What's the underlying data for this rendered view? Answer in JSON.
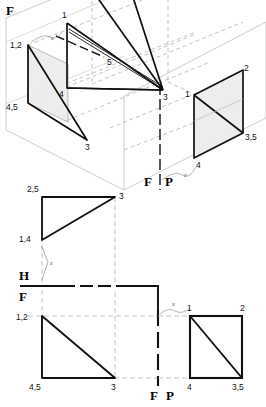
{
  "plate": {
    "title": "Descriptive Geometry — Point/Plane Projection Plate",
    "background_color": "#ffffff",
    "line_color": "#111111",
    "construction_color": "#9a9a9a",
    "shade_color": "#e8e8e8",
    "width": 266,
    "height": 407
  },
  "axonometric": {
    "name": "pictorial-axonometric-view",
    "plane_labels": {
      "frontal_top": "F",
      "frontal_bottom": "F",
      "profile_bottom": "P"
    },
    "vertex_labels": [
      {
        "text": "1,2",
        "x": 10,
        "y": 46
      },
      {
        "text": "4,5",
        "x": 8,
        "y": 108
      },
      {
        "text": "3",
        "x": 84,
        "y": 147
      },
      {
        "text": "4",
        "x": 60,
        "y": 90
      },
      {
        "text": "5",
        "x": 108,
        "y": 62
      },
      {
        "text": "1",
        "x": 61,
        "y": 14
      },
      {
        "text": "3",
        "x": 164,
        "y": 97
      },
      {
        "text": "1",
        "x": 186,
        "y": 94
      },
      {
        "text": "2",
        "x": 245,
        "y": 69
      },
      {
        "text": "3,5",
        "x": 245,
        "y": 137
      },
      {
        "text": "4",
        "x": 196,
        "y": 165
      }
    ],
    "dimension_marks": [
      {
        "text": "x",
        "x": 51,
        "y": 40
      },
      {
        "text": "x",
        "x": 186,
        "y": 177
      }
    ]
  },
  "top_view": {
    "name": "horizontal-projection-view",
    "plane_label": "H",
    "vertex_labels": [
      {
        "text": "2,5",
        "x": 29,
        "y": 190
      },
      {
        "text": "3",
        "x": 119,
        "y": 196
      },
      {
        "text": "1,4",
        "x": 22,
        "y": 240
      }
    ],
    "dimension_marks": [
      {
        "text": "x",
        "x": 48,
        "y": 265
      }
    ]
  },
  "fold_line": {
    "name": "h-f-fold-line",
    "upper_label": "H",
    "lower_label": "F"
  },
  "front_view": {
    "name": "frontal-projection-view",
    "vertex_labels": [
      {
        "text": "1,2",
        "x": 18,
        "y": 318
      },
      {
        "text": "4,5",
        "x": 31,
        "y": 385
      },
      {
        "text": "3",
        "x": 110,
        "y": 385
      }
    ]
  },
  "profile_view": {
    "name": "profile-projection-view",
    "vertex_labels": [
      {
        "text": "1",
        "x": 168,
        "y": 313
      },
      {
        "text": "2",
        "x": 243,
        "y": 313
      },
      {
        "text": "4",
        "x": 170,
        "y": 385
      },
      {
        "text": "3,5",
        "x": 236,
        "y": 385
      }
    ],
    "dimension_marks": [
      {
        "text": "x",
        "x": 150,
        "y": 308
      }
    ],
    "divider_labels": {
      "frontal": "F",
      "profile": "P"
    }
  }
}
